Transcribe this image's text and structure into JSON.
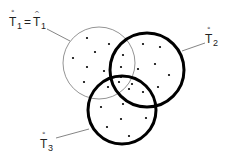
{
  "diagram": {
    "type": "venn",
    "colors": {
      "stroke": "#000000",
      "thin_stroke": "#888888",
      "dot": "#000000",
      "leader": "#666666"
    },
    "sets": [
      {
        "id": "T1",
        "style": "thin"
      },
      {
        "id": "T2",
        "style": "thick"
      },
      {
        "id": "T3",
        "style": "thick"
      }
    ],
    "labels": {
      "t1": {
        "base": "T",
        "sub": "1",
        "accent": "°",
        "equals": "=",
        "rhs_base": "T",
        "rhs_sub": "1",
        "rhs_accent": "^"
      },
      "t2": {
        "base": "T",
        "sub": "2",
        "accent": "°"
      },
      "t3": {
        "base": "T",
        "sub": "3",
        "accent": "°"
      }
    },
    "point_count": 27
  }
}
